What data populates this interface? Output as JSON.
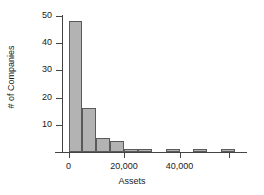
{
  "chart_data": {
    "type": "bar",
    "title": "",
    "subtitle": "",
    "xlabel": "Assets",
    "ylabel": "# of Companies",
    "grid": false,
    "legend": false,
    "legend_position": "none",
    "bin_width": 5000,
    "xlim": [
      -2000,
      60000
    ],
    "ylim": [
      0,
      50
    ],
    "x_ticks": [
      0,
      20000,
      40000
    ],
    "x_tick_labels": [
      "0",
      "20,000",
      "40,000"
    ],
    "y_ticks": [
      10,
      20,
      30,
      40,
      50
    ],
    "y_tick_labels": [
      "10",
      "20",
      "30",
      "40",
      "50"
    ],
    "bar_color": "#b3b3b3",
    "bar_edge_color": "#5a5a5a",
    "axis_color": "#444444",
    "bins": [
      {
        "x0": 0,
        "x1": 5000,
        "value": 48
      },
      {
        "x0": 5000,
        "x1": 10000,
        "value": 16
      },
      {
        "x0": 10000,
        "x1": 15000,
        "value": 5
      },
      {
        "x0": 15000,
        "x1": 20000,
        "value": 4
      },
      {
        "x0": 20000,
        "x1": 25000,
        "value": 1
      },
      {
        "x0": 25000,
        "x1": 30000,
        "value": 1
      },
      {
        "x0": 30000,
        "x1": 35000,
        "value": 0
      },
      {
        "x0": 35000,
        "x1": 40000,
        "value": 1
      },
      {
        "x0": 40000,
        "x1": 45000,
        "value": 0
      },
      {
        "x0": 45000,
        "x1": 50000,
        "value": 1
      },
      {
        "x0": 50000,
        "x1": 55000,
        "value": 0
      },
      {
        "x0": 55000,
        "x1": 60000,
        "value": 1
      }
    ],
    "categories": [
      "0-5,000",
      "5,000-10,000",
      "10,000-15,000",
      "15,000-20,000",
      "20,000-25,000",
      "25,000-30,000",
      "30,000-35,000",
      "35,000-40,000",
      "40,000-45,000",
      "45,000-50,000",
      "50,000-55,000",
      "55,000-60,000"
    ],
    "values": [
      48,
      16,
      5,
      4,
      1,
      1,
      0,
      1,
      0,
      1,
      0,
      1
    ]
  }
}
